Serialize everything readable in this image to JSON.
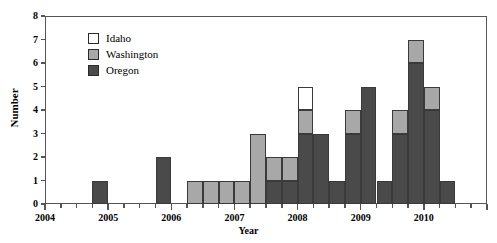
{
  "chart_data": {
    "type": "bar",
    "stacked": true,
    "title": "",
    "xlabel": "Year",
    "ylabel": "Number",
    "ylim": [
      0,
      8
    ],
    "yticks": [
      0,
      1,
      2,
      3,
      4,
      5,
      6,
      7,
      8
    ],
    "xlim": [
      2004,
      2011
    ],
    "xticks": [
      2004,
      2005,
      2006,
      2007,
      2008,
      2009,
      2010
    ],
    "xtick_labels": [
      "2004",
      "2005",
      "2006",
      "2007",
      "2008",
      "2009",
      "2010"
    ],
    "minor_xticks_per_year": 4,
    "grid": false,
    "legend_position": "upper-left-inside",
    "series": [
      {
        "name": "Oregon",
        "color": "#4a4a4a"
      },
      {
        "name": "Washington",
        "color": "#a8a8a8"
      },
      {
        "name": "Idaho",
        "color": "#ffffff"
      }
    ],
    "x_unit": "quarter",
    "bars": [
      {
        "x": 2004.5,
        "Oregon": 0,
        "Washington": 0,
        "Idaho": 0,
        "total": 0
      },
      {
        "x": 2004.75,
        "Oregon": 1,
        "Washington": 0,
        "Idaho": 0,
        "total": 1
      },
      {
        "x": 2005.75,
        "Oregon": 2,
        "Washington": 0,
        "Idaho": 0,
        "total": 2
      },
      {
        "x": 2006.25,
        "Oregon": 0,
        "Washington": 1,
        "Idaho": 0,
        "total": 1
      },
      {
        "x": 2006.5,
        "Oregon": 0,
        "Washington": 1,
        "Idaho": 0,
        "total": 1
      },
      {
        "x": 2006.75,
        "Oregon": 0,
        "Washington": 1,
        "Idaho": 0,
        "total": 1
      },
      {
        "x": 2007.0,
        "Oregon": 0,
        "Washington": 1,
        "Idaho": 0,
        "total": 1
      },
      {
        "x": 2007.25,
        "Oregon": 0,
        "Washington": 3,
        "Idaho": 0,
        "total": 3
      },
      {
        "x": 2007.5,
        "Oregon": 1,
        "Washington": 1,
        "Idaho": 0,
        "total": 2
      },
      {
        "x": 2007.75,
        "Oregon": 1,
        "Washington": 1,
        "Idaho": 0,
        "total": 2
      },
      {
        "x": 2008.0,
        "Oregon": 3,
        "Washington": 1,
        "Idaho": 1,
        "total": 5
      },
      {
        "x": 2008.25,
        "Oregon": 3,
        "Washington": 0,
        "Idaho": 0,
        "total": 3
      },
      {
        "x": 2008.5,
        "Oregon": 1,
        "Washington": 0,
        "Idaho": 0,
        "total": 1
      },
      {
        "x": 2008.75,
        "Oregon": 3,
        "Washington": 1,
        "Idaho": 0,
        "total": 4
      },
      {
        "x": 2009.0,
        "Oregon": 5,
        "Washington": 0,
        "Idaho": 0,
        "total": 5
      },
      {
        "x": 2009.25,
        "Oregon": 1,
        "Washington": 0,
        "Idaho": 0,
        "total": 1
      },
      {
        "x": 2009.5,
        "Oregon": 3,
        "Washington": 1,
        "Idaho": 0,
        "total": 4
      },
      {
        "x": 2009.75,
        "Oregon": 6,
        "Washington": 1,
        "Idaho": 0,
        "total": 7
      },
      {
        "x": 2010.0,
        "Oregon": 4,
        "Washington": 1,
        "Idaho": 0,
        "total": 5
      },
      {
        "x": 2010.25,
        "Oregon": 1,
        "Washington": 0,
        "Idaho": 0,
        "total": 1
      }
    ]
  }
}
